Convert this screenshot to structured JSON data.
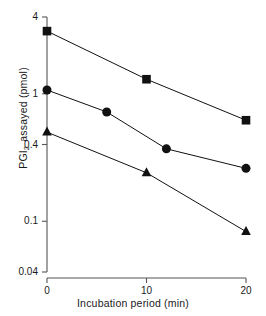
{
  "chart_data": {
    "type": "line",
    "title": "",
    "xlabel": "Incubation period  (min)",
    "ylabel": "PGI2 assayed  (pmol)",
    "ylabel_prefix": "PGI",
    "ylabel_sub": "2",
    "ylabel_suffix": "assayed  (pmol)",
    "yscale": "log",
    "xscale": "linear",
    "xlim": [
      0,
      20
    ],
    "ylim": [
      0.04,
      4
    ],
    "grid": false,
    "legend": "none",
    "xticks": [
      0,
      10,
      20
    ],
    "xtick_labels": [
      "0",
      "10",
      "20"
    ],
    "yticks": [
      4,
      1,
      0.4,
      0.1,
      0.04
    ],
    "ytick_labels": [
      "4",
      "1",
      "0.4",
      "0.1",
      "0.04"
    ],
    "series": [
      {
        "name": "square-series",
        "marker": "square",
        "color": "#111111",
        "x": [
          0,
          10,
          20
        ],
        "values": [
          3.1,
          1.3,
          0.62
        ]
      },
      {
        "name": "circle-series",
        "marker": "circle",
        "color": "#111111",
        "x": [
          0,
          6,
          12,
          20
        ],
        "values": [
          1.07,
          0.72,
          0.37,
          0.26
        ]
      },
      {
        "name": "triangle-series",
        "marker": "triangle",
        "color": "#111111",
        "x": [
          0,
          10,
          20
        ],
        "values": [
          0.5,
          0.24,
          0.083
        ]
      }
    ]
  },
  "axes": {
    "line_color": "#555555",
    "tick_font_size": "10px"
  }
}
